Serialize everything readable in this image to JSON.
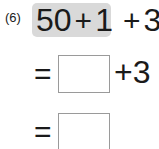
{
  "problem": {
    "number": "(6)",
    "expression": {
      "term1": "50",
      "op1": "+",
      "term2": "1",
      "op2": "+",
      "term3": "3"
    },
    "highlighted_part": "50 + 1",
    "highlight_color": "#d9d9d9",
    "step1": {
      "equals": "=",
      "blank": "",
      "op": "+",
      "term": "3"
    },
    "step2": {
      "equals": "=",
      "blank": ""
    }
  }
}
